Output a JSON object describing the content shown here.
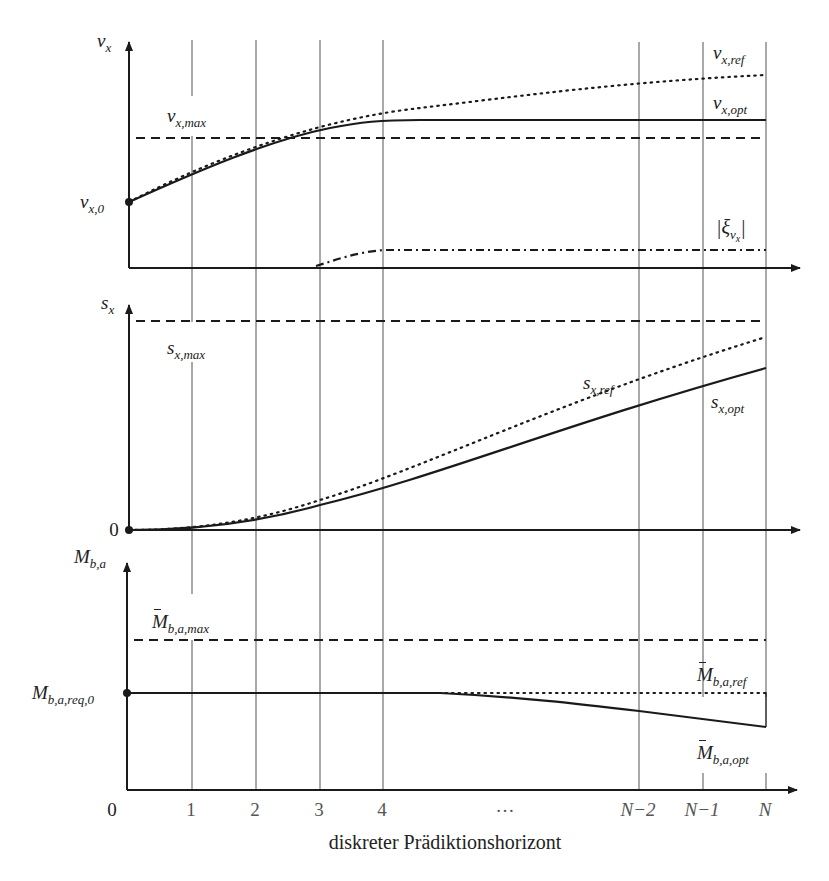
{
  "figure": {
    "x_axis": {
      "title": "diskreter Prädiktionshorizont",
      "ticks": [
        {
          "label": "0",
          "x": 129
        },
        {
          "label": "1",
          "x": 192
        },
        {
          "label": "2",
          "x": 256
        },
        {
          "label": "3",
          "x": 320
        },
        {
          "label": "4",
          "x": 383
        },
        {
          "label": "…",
          "x": 505
        },
        {
          "label": "N−2",
          "x": 639
        },
        {
          "label": "N−1",
          "x": 703
        },
        {
          "label": "N",
          "x": 766
        }
      ]
    },
    "panels": [
      {
        "id": "velocity",
        "y_label": {
          "base": "v",
          "sub": "x"
        },
        "initial_label": {
          "base": "v",
          "sub": "x,0"
        },
        "curves": [
          {
            "name": "v_x,max",
            "style": "dashed",
            "label": {
              "base": "v",
              "sub": "x,max",
              "bar": true
            }
          },
          {
            "name": "v_x,ref",
            "style": "dotted",
            "label": {
              "base": "v",
              "sub": "x,ref",
              "bar": true
            }
          },
          {
            "name": "v_x,opt",
            "style": "solid",
            "label": {
              "base": "v",
              "sub": "x,opt",
              "bar": true
            }
          },
          {
            "name": "|xi_vx|",
            "style": "dash-dot",
            "label": {
              "text": "|ξ",
              "sub": "v",
              "subsub": "x",
              "close": "|"
            }
          }
        ]
      },
      {
        "id": "position",
        "y_label": {
          "base": "s",
          "sub": "x"
        },
        "initial_label": {
          "text": "0"
        },
        "curves": [
          {
            "name": "s_x,max",
            "style": "dashed",
            "label": {
              "base": "s",
              "sub": "x,max",
              "bar": true
            }
          },
          {
            "name": "s_x,ref",
            "style": "dotted",
            "label": {
              "base": "s",
              "sub": "x,ref",
              "bar": true
            }
          },
          {
            "name": "s_x,opt",
            "style": "solid",
            "label": {
              "base": "s",
              "sub": "x,opt",
              "bar": true
            }
          }
        ]
      },
      {
        "id": "brake-torque",
        "y_label": {
          "base": "M",
          "sub": "b,a"
        },
        "initial_label": {
          "base": "M",
          "sub": "b,a,req,0"
        },
        "curves": [
          {
            "name": "M_b,a,max",
            "style": "dashed",
            "label": {
              "base": "M",
              "sub": "b,a,max",
              "bar": true
            }
          },
          {
            "name": "M_b,a,ref",
            "style": "dotted",
            "label": {
              "base": "M",
              "sub": "b,a,ref",
              "bar": true
            }
          },
          {
            "name": "M_b,a,opt",
            "style": "solid",
            "label": {
              "base": "M",
              "sub": "b,a,opt",
              "bar": true
            }
          }
        ]
      }
    ],
    "colors": {
      "ink": "#1a1a1a",
      "grid": "#6e6e6e",
      "tick_text": "#555555"
    }
  }
}
